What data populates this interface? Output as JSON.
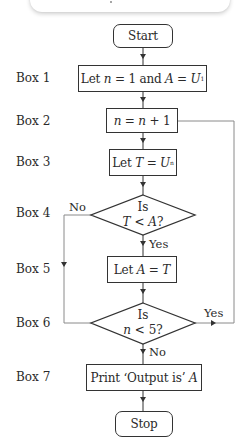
{
  "diagram": {
    "type": "flowchart",
    "nodes": {
      "start": {
        "label": "Start",
        "shape": "terminal"
      },
      "box1": {
        "row_label": "Box 1",
        "text_prefix": "Let ",
        "var_n": "n",
        "eq1": " = 1 and ",
        "var_A": "A",
        "eq2": " = ",
        "var_U": "U",
        "sub": "1",
        "shape": "process"
      },
      "box2": {
        "row_label": "Box 2",
        "var_n1": "n",
        "eq": " = ",
        "var_n2": "n",
        "rest": " + 1",
        "shape": "process"
      },
      "box3": {
        "row_label": "Box 3",
        "text_prefix": "Let ",
        "var_T": "T",
        "eq": " = ",
        "var_U": "U",
        "sub": "n",
        "shape": "process"
      },
      "box4": {
        "row_label": "Box 4",
        "line1": "Is",
        "var_T": "T",
        "op": " < ",
        "var_A": "A",
        "q": "?",
        "shape": "decision"
      },
      "box5": {
        "row_label": "Box 5",
        "text_prefix": "Let ",
        "var_A": "A",
        "eq": " = ",
        "var_T": "T",
        "shape": "process"
      },
      "box6": {
        "row_label": "Box 6",
        "line1": "Is",
        "var_n": "n",
        "op": " < 5?",
        "shape": "decision"
      },
      "box7": {
        "row_label": "Box 7",
        "text_prefix": "Print ‘Output is’ ",
        "var_A": "A",
        "shape": "process"
      },
      "stop": {
        "label": "Stop",
        "shape": "terminal"
      }
    },
    "edges": {
      "box4_no": "No",
      "box4_yes": "Yes",
      "box6_yes": "Yes",
      "box6_no": "No"
    },
    "colors": {
      "stroke": "#333333",
      "loop_stroke": "#8a8a8a",
      "text": "#2a2a2a"
    }
  }
}
